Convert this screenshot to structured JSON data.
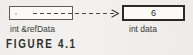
{
  "figure": {
    "caption": "FIGURE 4.1",
    "background_color": "#f2f1ef",
    "ink_color": "#2b2a28"
  },
  "diagram_data": {
    "type": "diagram",
    "description": "C++ reference binding diagram: an int reference named refData is bound to an int variable named data holding the value 6.",
    "nodes": [
      {
        "id": "reference",
        "label": "int &refData",
        "value": "",
        "box_style": "thin-border",
        "border_color": "#5e5c59",
        "fill_color": "#fbfaf8"
      },
      {
        "id": "variable",
        "label": "int data",
        "value": "6",
        "box_style": "thick-border",
        "border_color": "#2b2a28",
        "fill_color": "#fbfaf8"
      }
    ],
    "edges": [
      {
        "id": "binding",
        "from": "reference",
        "to": "variable",
        "style": "dashed",
        "arrowhead": "open-right",
        "color": "#4a4845"
      }
    ]
  },
  "labels": {
    "reference_label": "int &refData",
    "variable_label": "int data",
    "variable_value": "6"
  }
}
